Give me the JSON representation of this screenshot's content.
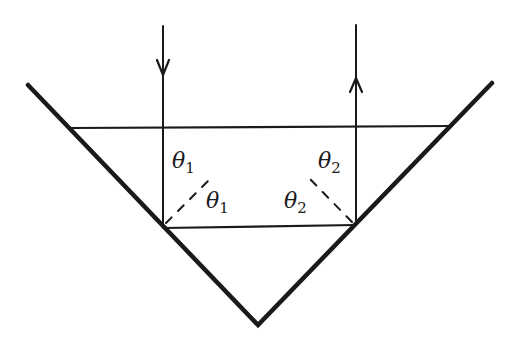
{
  "diagram": {
    "labels": {
      "theta1_upper": {
        "symbol": "θ",
        "sub": "1"
      },
      "theta1_lower": {
        "symbol": "θ",
        "sub": "1"
      },
      "theta2_upper": {
        "symbol": "θ",
        "sub": "2"
      },
      "theta2_lower": {
        "symbol": "θ",
        "sub": "2"
      }
    },
    "colors": {
      "stroke": "#1a1a1a",
      "background": "#ffffff"
    }
  }
}
